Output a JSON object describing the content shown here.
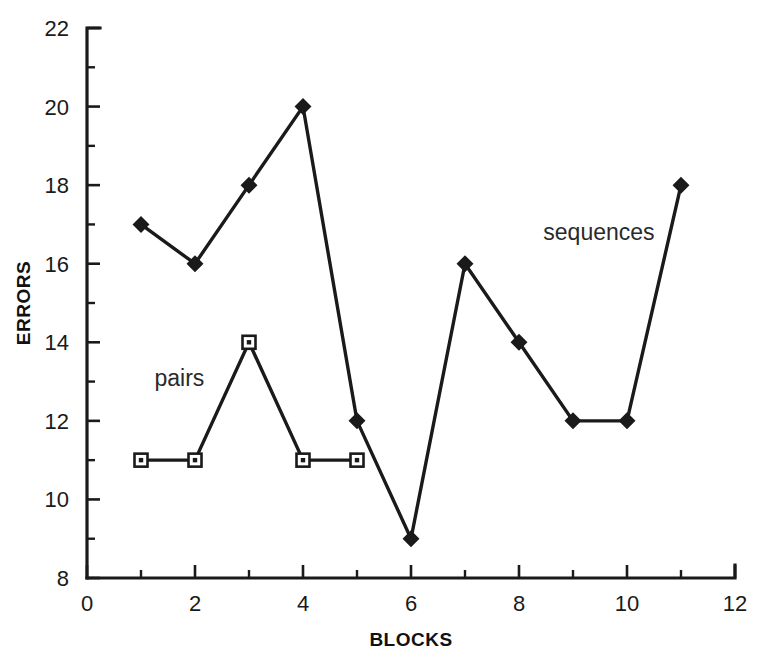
{
  "chart_data": {
    "type": "line",
    "title": "",
    "subtitle": "",
    "xlabel": "BLOCKS",
    "ylabel": "ERRORS",
    "x": [
      1,
      2,
      3,
      4,
      5,
      6,
      7,
      8,
      9,
      10,
      11
    ],
    "xlim": [
      0,
      12
    ],
    "ylim": [
      8,
      22
    ],
    "x_ticks_major": [
      0,
      2,
      4,
      6,
      8,
      10,
      12
    ],
    "x_ticks_minor": [
      1,
      3,
      5,
      7,
      9,
      11
    ],
    "x_tick_labels": [
      "0",
      "2",
      "4",
      "6",
      "8",
      "10",
      "12"
    ],
    "y_ticks_major": [
      8,
      10,
      12,
      14,
      16,
      18,
      20,
      22
    ],
    "y_ticks_minor": [
      9,
      11,
      13,
      15,
      17,
      19,
      21
    ],
    "y_tick_labels": [
      "8",
      "10",
      "12",
      "14",
      "16",
      "18",
      "20",
      "22"
    ],
    "grid": false,
    "legend_position": "inline-annotations",
    "line_color": "#1a1a1a",
    "background_color": "#ffffff",
    "series": [
      {
        "name": "sequences",
        "marker": "filled-diamond",
        "x": [
          1,
          2,
          3,
          4,
          5,
          6,
          7,
          8,
          9,
          10,
          11
        ],
        "values": [
          17,
          16,
          18,
          20,
          12,
          9,
          16,
          14,
          12,
          12,
          18
        ],
        "label_x": 8.45,
        "label_y": 16.6
      },
      {
        "name": "pairs",
        "marker": "open-square-dot",
        "x": [
          1,
          2,
          3,
          4,
          5
        ],
        "values": [
          11,
          11,
          14,
          11,
          11
        ],
        "label_x": 1.25,
        "label_y": 12.9
      }
    ],
    "annotations": [
      {
        "text": "sequences",
        "x": 8.45,
        "y": 16.6
      },
      {
        "text": "pairs",
        "x": 1.25,
        "y": 12.9
      }
    ]
  }
}
